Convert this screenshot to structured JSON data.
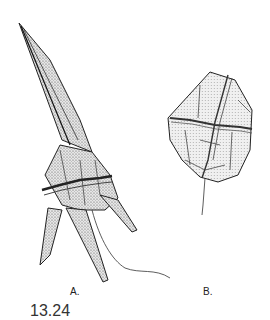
{
  "figure": {
    "panels": [
      {
        "id": "A",
        "label": "A.",
        "subject": "spined-dinoflagellate-illustration"
      },
      {
        "id": "B",
        "label": "B.",
        "subject": "oval-dinoflagellate-illustration"
      }
    ],
    "caption_partial": "13.24"
  }
}
